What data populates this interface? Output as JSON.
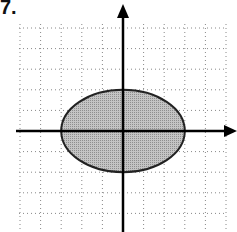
{
  "problem": {
    "number_label": "7."
  },
  "graph": {
    "type": "coordinate-grid-with-ellipse",
    "grid_unit_px": 20.6,
    "origin_px": {
      "x": 123,
      "y": 131
    },
    "x_range_units": [
      -5,
      5
    ],
    "y_range_units": [
      -5,
      5
    ],
    "gridline_style": "dotted",
    "axes": {
      "x_arrow": true,
      "y_arrow": true
    },
    "ellipse": {
      "center": [
        0,
        0
      ],
      "semi_major_x": 3,
      "semi_minor_y": 2,
      "equation": "x^2/9 + y^2/4 = 1",
      "fill_color": "#b5b5b5",
      "stroke_color": "#222222"
    }
  },
  "colors": {
    "grid": "#888888",
    "axis": "#000000",
    "background": "#ffffff"
  }
}
